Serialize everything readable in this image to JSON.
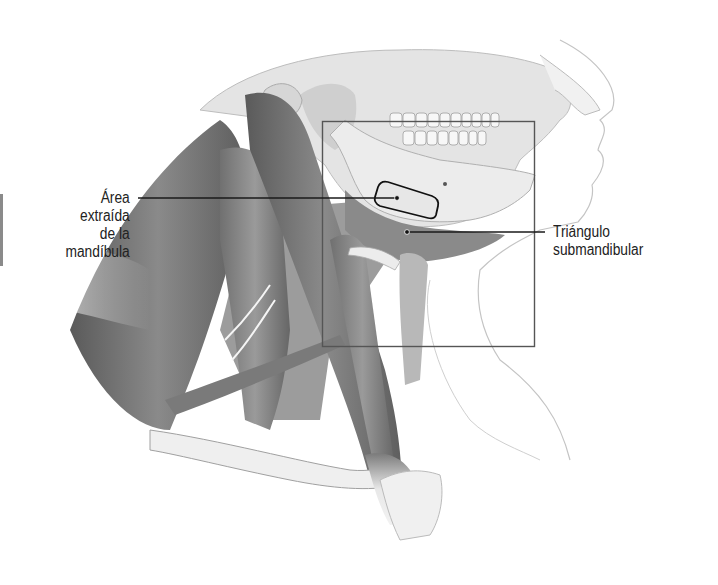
{
  "figure": {
    "style": "grayscale medical illustration",
    "inset_box": {
      "x": 322,
      "y": 121,
      "width": 213,
      "height": 226
    }
  },
  "labels": {
    "area_extraida": {
      "lines": [
        "Área",
        "extraída",
        "de la",
        "mandíbula"
      ]
    },
    "triangulo": {
      "lines": [
        "Triángulo",
        "submandibular"
      ]
    }
  },
  "colors": {
    "background": "#ffffff",
    "muscle_dark": "#6b6b6b",
    "muscle_mid": "#8c8c8c",
    "bone": "#e6e6e6",
    "skin_outline": "#bdbdbd",
    "leader_line": "#1a1a1a",
    "box_stroke": "#555555"
  }
}
